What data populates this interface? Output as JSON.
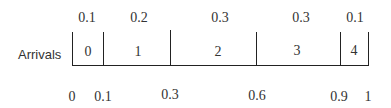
{
  "diagram": {
    "row_label": "Arrivals",
    "segments": [
      {
        "value": "0",
        "probability": "0.1",
        "start": 0.0,
        "end": 0.1
      },
      {
        "value": "1",
        "probability": "0.2",
        "start": 0.1,
        "end": 0.3
      },
      {
        "value": "2",
        "probability": "0.3",
        "start": 0.3,
        "end": 0.6
      },
      {
        "value": "3",
        "probability": "0.3",
        "start": 0.6,
        "end": 0.9
      },
      {
        "value": "4",
        "probability": "0.1",
        "start": 0.9,
        "end": 1.0
      }
    ],
    "cumulative_ticks": [
      "0",
      "0.1",
      "0.3",
      "0.6",
      "0.9",
      "1"
    ]
  }
}
